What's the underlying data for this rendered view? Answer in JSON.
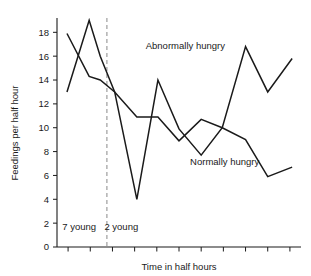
{
  "chart_data": {
    "type": "line",
    "title": "",
    "xlabel": "Time in half hours",
    "ylabel": "Feedings per half hour",
    "ylim": [
      0,
      19.2
    ],
    "xlim": [
      0,
      11
    ],
    "grid": false,
    "legend": "inline-annotations",
    "ytick_labels": [
      "0",
      "2",
      "4",
      "6",
      "8",
      "10",
      "12",
      "14",
      "16",
      "18"
    ],
    "ytick_values": [
      0,
      2,
      4,
      6,
      8,
      10,
      12,
      14,
      16,
      18
    ],
    "xtick_values": [
      0.5,
      1.5,
      2.5,
      3.5,
      4.5,
      5.5,
      6.5,
      7.5,
      8.5,
      9.5,
      10.5
    ],
    "xtick_labels": [
      "",
      "",
      "",
      "",
      "",
      "",
      "",
      "",
      "",
      "",
      ""
    ],
    "series": [
      {
        "name": "Abnormally hungry",
        "x": [
          0.45,
          1.45,
          1.95,
          2.6,
          3.6,
          4.55,
          5.5,
          6.5,
          7.45,
          8.5,
          9.5,
          10.6
        ],
        "values": [
          13.0,
          19.0,
          16.0,
          13.0,
          4.0,
          14.0,
          9.9,
          7.7,
          10.0,
          16.8,
          13.0,
          15.8
        ]
      },
      {
        "name": "Normally hungry",
        "x": [
          0.45,
          1.45,
          1.95,
          2.6,
          3.6,
          4.55,
          5.5,
          6.5,
          7.45,
          8.5,
          9.5,
          10.6
        ],
        "values": [
          17.9,
          14.3,
          14.0,
          13.0,
          10.9,
          10.9,
          8.9,
          10.7,
          10.0,
          9.0,
          5.9,
          6.7
        ]
      }
    ],
    "annotations": [
      {
        "name": "Abnormally hungry",
        "text": "Abnormally hungry",
        "x": 4.0,
        "y": 16.6
      },
      {
        "name": "Normally hungry",
        "text": "Normally hungry",
        "x": 6.0,
        "y": 6.9
      }
    ],
    "panels": [
      {
        "name": "left-panel",
        "text": "7 young",
        "x": 1.0,
        "y": 1.4
      },
      {
        "name": "right-panel",
        "text": "2 young",
        "x": 2.9,
        "y": 1.4
      }
    ],
    "divider": {
      "name": "panel-divider",
      "x": 2.25,
      "style": "dashed",
      "color": "#8a8a8a"
    }
  },
  "colors": {
    "line": "#1a1a1a",
    "axis": "#1a1a1a",
    "divider": "#8a8a8a",
    "background": "#ffffff"
  }
}
